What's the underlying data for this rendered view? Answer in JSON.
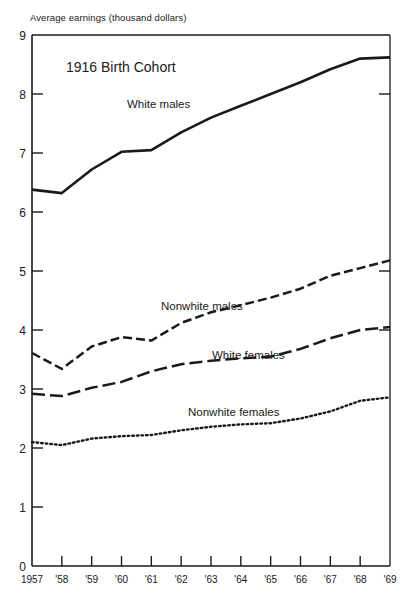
{
  "axis_title": "Average earnings (thousand dollars)",
  "annotation": "1916 Birth Cohort",
  "labels": {
    "white_males": "White males",
    "nonwhite_males": "Nonwhite males",
    "white_females": "White females",
    "nonwhite_females": "Nonwhite females"
  },
  "y_ticks": [
    "0",
    "1",
    "2",
    "3",
    "4",
    "5",
    "6",
    "7",
    "8",
    "9"
  ],
  "x_ticks": [
    "1957",
    "'58",
    "'59",
    "'60",
    "'61",
    "'62",
    "'63",
    "'64",
    "'65",
    "'66",
    "'67",
    "'68",
    "'69"
  ],
  "colors": {
    "ink": "#1a1a1a",
    "background": "#ffffff"
  },
  "chart_data": {
    "type": "line",
    "title": "1916 Birth Cohort",
    "xlabel": "",
    "ylabel": "Average earnings (thousand dollars)",
    "xlim": [
      1957,
      1969
    ],
    "ylim": [
      0,
      9
    ],
    "grid": false,
    "legend": "inline-annotations",
    "x": [
      1957,
      1958,
      1959,
      1960,
      1961,
      1962,
      1963,
      1964,
      1965,
      1966,
      1967,
      1968,
      1969
    ],
    "xtick_labels": [
      "1957",
      "'58",
      "'59",
      "'60",
      "'61",
      "'62",
      "'63",
      "'64",
      "'65",
      "'66",
      "'67",
      "'68",
      "'69"
    ],
    "ytick_values": [
      0,
      1,
      2,
      3,
      4,
      5,
      6,
      7,
      8,
      9
    ],
    "series": [
      {
        "name": "White males",
        "style": "solid",
        "values": [
          6.38,
          6.32,
          6.72,
          7.02,
          7.05,
          7.35,
          7.6,
          7.8,
          8.0,
          8.2,
          8.42,
          8.6,
          8.62
        ]
      },
      {
        "name": "Nonwhite males",
        "style": "dashed",
        "values": [
          3.61,
          3.34,
          3.72,
          3.88,
          3.82,
          4.12,
          4.3,
          4.42,
          4.55,
          4.7,
          4.92,
          5.05,
          5.18
        ]
      },
      {
        "name": "White females",
        "style": "long-dash",
        "values": [
          2.92,
          2.88,
          3.02,
          3.12,
          3.3,
          3.42,
          3.48,
          3.52,
          3.55,
          3.68,
          3.86,
          4.0,
          4.05
        ]
      },
      {
        "name": "Nonwhite females",
        "style": "dotted",
        "values": [
          2.1,
          2.05,
          2.16,
          2.2,
          2.22,
          2.3,
          2.36,
          2.4,
          2.42,
          2.5,
          2.62,
          2.8,
          2.86
        ]
      }
    ]
  }
}
